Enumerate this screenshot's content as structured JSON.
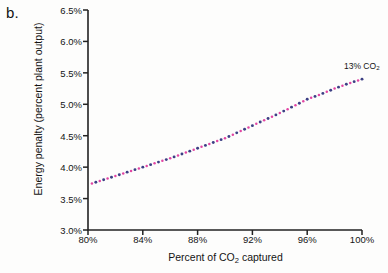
{
  "figure": {
    "panel_label": "b.",
    "annotation": {
      "text_main": "13% CO",
      "text_sub": "2"
    }
  },
  "chart_data": {
    "type": "line",
    "title": "",
    "subtitle": "",
    "xlabel_main": "Percent of CO",
    "xlabel_sub": "2",
    "xlabel_tail": " captured",
    "ylabel": "Energy penalty (percent plant output)",
    "xlim": [
      80,
      100
    ],
    "ylim": [
      3.0,
      6.5
    ],
    "grid": false,
    "legend_position": "none",
    "xticks": [
      80,
      84,
      88,
      92,
      96,
      100
    ],
    "xtick_labels": [
      "80%",
      "84%",
      "88%",
      "92%",
      "96%",
      "100%"
    ],
    "yticks": [
      3.0,
      3.5,
      4.0,
      4.5,
      5.0,
      5.5,
      6.0,
      6.5
    ],
    "ytick_labels": [
      "3.0%",
      "3.5%",
      "4.0%",
      "4.5%",
      "5.0%",
      "5.5%",
      "6.0%",
      "6.5%"
    ],
    "series": [
      {
        "name": "13% CO2",
        "style": "dotted",
        "color_primary": "#e0359b",
        "color_secondary": "#2b2f7a",
        "x": [
          80,
          81,
          82,
          83,
          84,
          85,
          86,
          87,
          88,
          89,
          90,
          91,
          92,
          93,
          94,
          95,
          96,
          97,
          98,
          99,
          100
        ],
        "values": [
          3.72,
          3.79,
          3.86,
          3.93,
          4.0,
          4.07,
          4.14,
          4.22,
          4.3,
          4.38,
          4.46,
          4.56,
          4.66,
          4.76,
          4.86,
          4.97,
          5.08,
          5.16,
          5.25,
          5.33,
          5.4
        ]
      }
    ],
    "annotations": [
      {
        "label": "13% CO2",
        "x": 100,
        "y": 5.4
      }
    ],
    "axis_color": "#222222",
    "background": "#fdfdfc"
  }
}
